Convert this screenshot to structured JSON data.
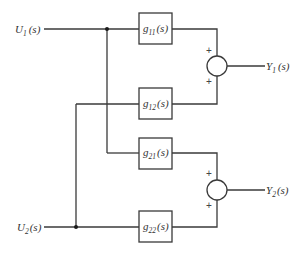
{
  "diagram": {
    "inputs": [
      {
        "id": "U1",
        "base": "U",
        "sub": "1",
        "arg": "(s)"
      },
      {
        "id": "U2",
        "base": "U",
        "sub": "2",
        "arg": "(s)"
      }
    ],
    "outputs": [
      {
        "id": "Y1",
        "base": "Y",
        "sub": "1",
        "arg": "(s)"
      },
      {
        "id": "Y2",
        "base": "Y",
        "sub": "2",
        "arg": "(s)"
      }
    ],
    "blocks": [
      {
        "id": "g11",
        "base": "g",
        "sub": "11",
        "arg": "(s)",
        "from": "U1",
        "to": "Y1"
      },
      {
        "id": "g12",
        "base": "g",
        "sub": "12",
        "arg": "(s)",
        "from": "U2",
        "to": "Y1"
      },
      {
        "id": "g21",
        "base": "g",
        "sub": "21",
        "arg": "(s)",
        "from": "U1",
        "to": "Y2"
      },
      {
        "id": "g22",
        "base": "g",
        "sub": "22",
        "arg": "(s)",
        "from": "U2",
        "to": "Y2"
      }
    ],
    "summing_junctions": [
      {
        "id": "sum1",
        "output": "Y1",
        "signs": [
          "+",
          "+"
        ]
      },
      {
        "id": "sum2",
        "output": "Y2",
        "signs": [
          "+",
          "+"
        ]
      }
    ]
  }
}
